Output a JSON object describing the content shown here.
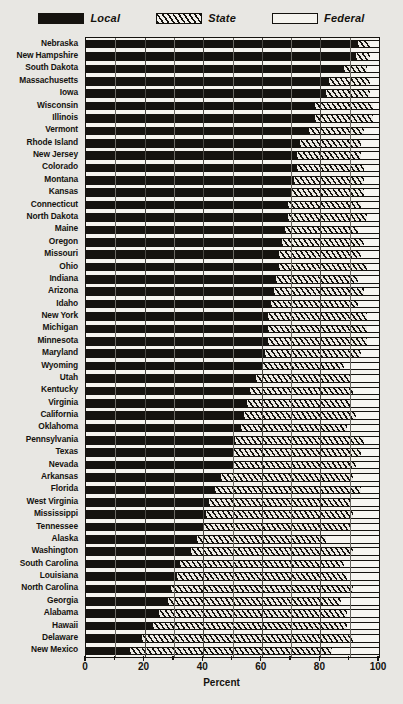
{
  "chart_data": {
    "type": "bar",
    "orientation": "horizontal",
    "stacked": true,
    "title": "",
    "xlabel": "Percent",
    "ylabel": "",
    "xlim": [
      0,
      100
    ],
    "xticks": [
      0,
      20,
      40,
      60,
      80,
      100
    ],
    "grid": true,
    "legend_position": "top",
    "series": [
      {
        "name": "Local",
        "pattern": "solid-black",
        "color": "#15130f"
      },
      {
        "name": "State",
        "pattern": "diagonal-hatch",
        "color": "#15130f"
      },
      {
        "name": "Federal",
        "pattern": "open-white",
        "color": "#f7f6f1"
      }
    ],
    "categories": [
      "Nebraska",
      "New Hampshire",
      "South Dakota",
      "Massachusetts",
      "Iowa",
      "Wisconsin",
      "Illinois",
      "Vermont",
      "Rhode Island",
      "New Jersey",
      "Colorado",
      "Montana",
      "Kansas",
      "Connecticut",
      "North Dakota",
      "Maine",
      "Oregon",
      "Missouri",
      "Ohio",
      "Indiana",
      "Arizona",
      "Idaho",
      "New York",
      "Michigan",
      "Minnesota",
      "Maryland",
      "Wyoming",
      "Utah",
      "Kentucky",
      "Virginia",
      "California",
      "Oklahoma",
      "Pennsylvania",
      "Texas",
      "Nevada",
      "Arkansas",
      "Florida",
      "West Virginia",
      "Mississippi",
      "Tennessee",
      "Alaska",
      "Washington",
      "South Carolina",
      "Louisiana",
      "North Carolina",
      "Georgia",
      "Alabama",
      "Hawaii",
      "Delaware",
      "New Mexico"
    ],
    "values": {
      "Local": [
        93,
        92,
        88,
        83,
        82,
        78,
        78,
        76,
        73,
        72,
        72,
        71,
        70,
        69,
        69,
        68,
        67,
        66,
        66,
        65,
        64,
        63,
        62,
        62,
        62,
        61,
        60,
        58,
        56,
        55,
        54,
        53,
        51,
        50,
        50,
        46,
        44,
        42,
        41,
        40,
        38,
        36,
        32,
        31,
        29,
        28,
        25,
        23,
        19,
        15
      ],
      "State": [
        4,
        5,
        8,
        14,
        15,
        20,
        20,
        19,
        21,
        22,
        23,
        24,
        25,
        25,
        27,
        25,
        28,
        28,
        30,
        28,
        31,
        30,
        34,
        34,
        34,
        33,
        28,
        32,
        35,
        35,
        38,
        36,
        44,
        44,
        42,
        45,
        50,
        48,
        50,
        50,
        44,
        55,
        56,
        58,
        62,
        59,
        64,
        66,
        72,
        69
      ],
      "Federal": [
        3,
        3,
        4,
        3,
        3,
        2,
        2,
        5,
        6,
        6,
        5,
        5,
        5,
        6,
        4,
        7,
        5,
        6,
        4,
        7,
        5,
        7,
        4,
        4,
        4,
        6,
        12,
        10,
        9,
        10,
        8,
        11,
        5,
        6,
        8,
        9,
        6,
        10,
        9,
        10,
        18,
        9,
        12,
        11,
        9,
        13,
        11,
        11,
        9,
        16
      ]
    }
  },
  "legend": {
    "items": [
      {
        "label": "Local",
        "swatch": "solid-black-swatch"
      },
      {
        "label": "State",
        "swatch": "hatched-swatch"
      },
      {
        "label": "Federal",
        "swatch": "open-swatch"
      }
    ]
  },
  "axis": {
    "x_title": "Percent",
    "x_tick_labels": [
      "0",
      "20",
      "40",
      "60",
      "80",
      "100"
    ]
  },
  "colors": {
    "ink": "#15130f",
    "paper": "#e8e7e3",
    "plot_bg": "#f5f4ef",
    "grid": "#4a4843"
  }
}
